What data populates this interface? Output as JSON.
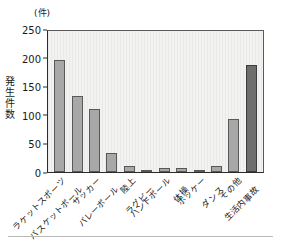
{
  "chart_data": {
    "type": "bar",
    "title": "",
    "unit_caption": "(件)",
    "ylabel": "発生件数",
    "xlabel": "",
    "ylim": [
      0,
      250
    ],
    "yticks": [
      250,
      200,
      150,
      100,
      50,
      0
    ],
    "grid": false,
    "legend": "none",
    "categories": [
      "ラケットスポーツ",
      "バスケットボール",
      "サッカー",
      "バレーボール",
      "陸上",
      "ラグビー",
      "ハンドボール",
      "体操",
      "ホッケー",
      "ダンス",
      "その他",
      "生活内事故"
    ],
    "values": [
      196,
      133,
      110,
      33,
      10,
      2,
      7,
      7,
      4,
      11,
      93,
      187
    ],
    "bar_styles": [
      "light",
      "light",
      "light",
      "light",
      "light",
      "light",
      "light",
      "light",
      "light",
      "light",
      "light",
      "accent"
    ],
    "colors": {
      "bar_light_fill": "#a8a8a8",
      "bar_light_stroke": "#595959",
      "bar_accent_fill": "#6e6e6e",
      "bar_accent_stroke": "#3c3c3c",
      "plot_background": "#f2f2f0",
      "axis": "#2b2b2b",
      "text": "#1a1a1a"
    }
  }
}
